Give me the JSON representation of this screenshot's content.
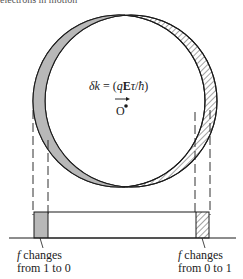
{
  "caption_fragment": "electrons in motion",
  "equation": {
    "lhs": "δk",
    "eq": " = ",
    "rhs_open": "(",
    "q": "q",
    "E": "E",
    "tau": "τ",
    "slash": "/",
    "hbar": "ħ",
    "rhs_close": ")"
  },
  "origin_label": "O",
  "left_label": {
    "f": "f",
    "line1": " changes",
    "line2": "from 1 to 0"
  },
  "right_label": {
    "f": "f",
    "line1": " changes",
    "line2": "from 0 to 1"
  },
  "colors": {
    "stroke": "#1a1a1a",
    "shaded_fill": "#b8b8b8",
    "hatch": "#333333"
  }
}
